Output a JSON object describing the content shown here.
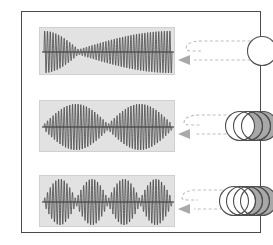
{
  "figure": {
    "title_visible": false,
    "canvas": {
      "width": 273,
      "height": 245,
      "background": "#ffffff"
    },
    "frame": {
      "x": 21,
      "y": 11,
      "width": 240,
      "height": 222,
      "stroke": "#4a4a4a",
      "stroke_width": 1.6
    }
  },
  "palette": {
    "panel_fill": "#e2e2e2",
    "panel_stroke": "#d0d0d0",
    "wave_stroke": "#3a3a3a",
    "axis_stroke": "#2e2e2e",
    "arrow_color": "#a9a9a9",
    "circle_stroke": "#4f4f4f",
    "circle_fill_empty": "#ffffff",
    "circle_fill_gray": "#a8a8a8",
    "frame_stroke": "#4a4a4a"
  },
  "chart_data": {
    "type": "line",
    "title": "",
    "xlabel": "",
    "ylabel": "",
    "panels": [
      {
        "id": "waveform-row-1",
        "label": "",
        "carrier_cycles": 46,
        "envelope_lobes": 2,
        "envelope_nodes": 1,
        "node_positions": [
          0.27
        ],
        "amplitude": 1.0,
        "asymmetric": true,
        "x": [
          0,
          1
        ],
        "ylim": [
          -1,
          1
        ]
      },
      {
        "id": "waveform-row-2",
        "label": "",
        "carrier_cycles": 46,
        "envelope_lobes": 2,
        "envelope_nodes": 1,
        "node_positions": [
          0.5
        ],
        "amplitude": 1.0,
        "asymmetric": false,
        "x": [
          0,
          1
        ],
        "ylim": [
          -1,
          1
        ]
      },
      {
        "id": "waveform-row-3",
        "label": "",
        "carrier_cycles": 46,
        "envelope_lobes": 4,
        "envelope_nodes": 3,
        "node_positions": [
          0.25,
          0.5,
          0.75
        ],
        "amplitude": 1.0,
        "asymmetric": false,
        "x": [
          0,
          1
        ],
        "ylim": [
          -1,
          1
        ]
      }
    ],
    "source_groups": [
      {
        "id": "circle-group-row-1",
        "count": 1,
        "filled_count": 0,
        "filled_color": "#a8a8a8"
      },
      {
        "id": "circle-group-row-2",
        "count": 4,
        "filled_count": 2,
        "filled_color": "#a8a8a8"
      },
      {
        "id": "circle-group-row-3",
        "count": 5,
        "filled_count": 3,
        "filled_color": "#a8a8a8"
      }
    ],
    "connectors": [
      {
        "id": "connector-row-1",
        "style": "dashed",
        "direction": "right-to-left",
        "arrowhead": true
      },
      {
        "id": "connector-row-2",
        "style": "dashed",
        "direction": "right-to-left",
        "arrowhead": true
      },
      {
        "id": "connector-row-3",
        "style": "dashed",
        "direction": "right-to-left",
        "arrowhead": true
      }
    ],
    "grid": false,
    "legend": null
  },
  "rows": [
    {
      "panel": {
        "x": 17,
        "y": 15,
        "width": 136,
        "height": 48
      },
      "circles_cx": 239,
      "circles_cy": 39
    },
    {
      "panel": {
        "x": 17,
        "y": 88,
        "width": 136,
        "height": 52
      },
      "circles_cx": 234,
      "circles_cy": 113
    },
    {
      "panel": {
        "x": 17,
        "y": 163,
        "width": 136,
        "height": 52
      },
      "circles_cx": 231,
      "circles_cy": 188
    }
  ]
}
